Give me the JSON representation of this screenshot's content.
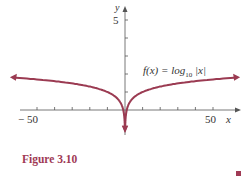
{
  "chart_data": {
    "type": "line",
    "title": "",
    "function_label": "f(x) = log10 |x|",
    "xlabel": "x",
    "ylabel": "y",
    "x_tick_labels": [
      "-50",
      "50"
    ],
    "y_tick_labels": [
      "5"
    ],
    "x_ticks": [
      -50,
      -40,
      -30,
      -20,
      -10,
      10,
      20,
      30,
      40,
      50
    ],
    "y_ticks": [
      1,
      2,
      3,
      4,
      5
    ],
    "xlim": [
      -60,
      60
    ],
    "ylim": [
      -1.5,
      5.5
    ],
    "grid": false,
    "series": [
      {
        "name": "f(x) = log10|x|",
        "color": "#9b3b52",
        "x": [
          -62,
          -50,
          -40,
          -30,
          -20,
          -10,
          -5,
          -2,
          -1,
          -0.5,
          -0.2,
          0.2,
          0.5,
          1,
          2,
          5,
          10,
          20,
          30,
          40,
          50,
          62
        ],
        "values": [
          1.79,
          1.7,
          1.6,
          1.48,
          1.3,
          1.0,
          0.7,
          0.3,
          0,
          -0.3,
          -0.7,
          -0.7,
          -0.3,
          0,
          0.3,
          0.7,
          1.0,
          1.3,
          1.48,
          1.6,
          1.7,
          1.79
        ]
      }
    ]
  },
  "labels": {
    "y_axis": "y",
    "x_axis": "x",
    "y_tick_5": "5",
    "x_tick_neg50": "− 50",
    "x_tick_50": "50",
    "func_prefix": "f(x) =  log",
    "func_sub": "10",
    "func_suffix": " |x|"
  },
  "caption": "Figure 3.10",
  "colors": {
    "curve": "#9b3b52",
    "caption": "#a03a55",
    "axis": "#555555"
  }
}
